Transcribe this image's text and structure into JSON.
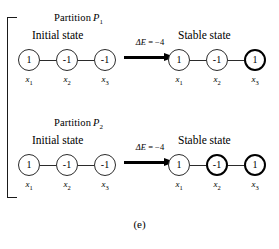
{
  "figure": {
    "caption": "(e)",
    "bracket": "group-bracket"
  },
  "partitions": [
    {
      "label_prefix": "Partition",
      "label_var": "P",
      "label_sub": "1",
      "initial_heading": "Initial state",
      "stable_heading": "Stable state",
      "transition": {
        "delta_symbol": "Δ",
        "delta_var": "E",
        "delta_eq": " = −4",
        "arrow": "right-arrow"
      },
      "initial_nodes": [
        {
          "value": "1",
          "label": "x",
          "sub": "1",
          "bold": false
        },
        {
          "value": "-1",
          "label": "x",
          "sub": "2",
          "bold": false
        },
        {
          "value": "-1",
          "label": "x",
          "sub": "3",
          "bold": false
        }
      ],
      "stable_nodes": [
        {
          "value": "1",
          "label": "x",
          "sub": "1",
          "bold": false
        },
        {
          "value": "-1",
          "label": "x",
          "sub": "2",
          "bold": false
        },
        {
          "value": "1",
          "label": "x",
          "sub": "3",
          "bold": true
        }
      ]
    },
    {
      "label_prefix": "Partition",
      "label_var": "P",
      "label_sub": "2",
      "initial_heading": "Initial state",
      "stable_heading": "Stable state",
      "transition": {
        "delta_symbol": "Δ",
        "delta_var": "E",
        "delta_eq": " = −4",
        "arrow": "right-arrow"
      },
      "initial_nodes": [
        {
          "value": "1",
          "label": "x",
          "sub": "1",
          "bold": false
        },
        {
          "value": "-1",
          "label": "x",
          "sub": "2",
          "bold": false
        },
        {
          "value": "-1",
          "label": "x",
          "sub": "3",
          "bold": false
        }
      ],
      "stable_nodes": [
        {
          "value": "1",
          "label": "x",
          "sub": "1",
          "bold": false
        },
        {
          "value": "-1",
          "label": "x",
          "sub": "2",
          "bold": true
        },
        {
          "value": "1",
          "label": "x",
          "sub": "3",
          "bold": true
        }
      ]
    }
  ]
}
